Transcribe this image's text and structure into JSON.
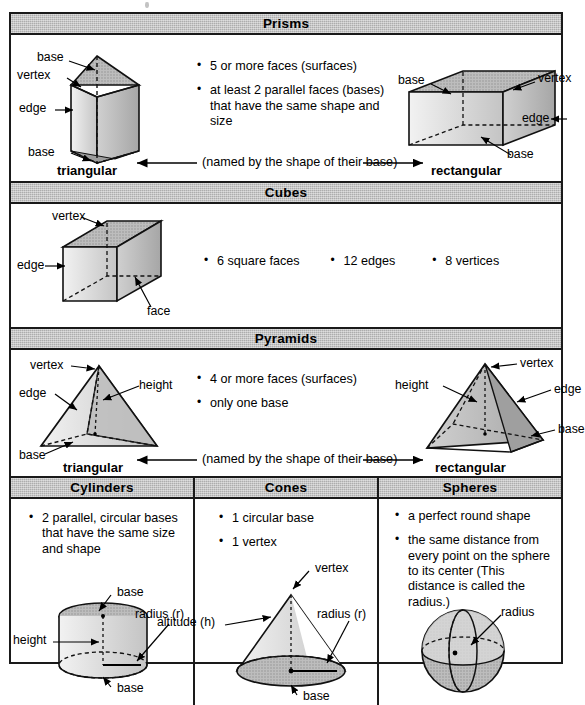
{
  "poster": {
    "title": "Solid Figures Reference Chart"
  },
  "sections": {
    "prisms": {
      "header": "Prisms",
      "bullets": [
        "5 or more faces (surfaces)",
        "at least 2 parallel faces (bases) that have the same shape and size"
      ],
      "named_by": "(named by the shape of their base)",
      "left_name": "triangular",
      "right_name": "rectangular",
      "left_labels": {
        "base_top": "base",
        "vertex": "vertex",
        "edge": "edge",
        "base_bottom": "base"
      },
      "right_labels": {
        "base_top": "base",
        "vertex": "vertex",
        "edge": "edge",
        "base_bottom": "base"
      }
    },
    "cubes": {
      "header": "Cubes",
      "bullets": [
        "6 square faces",
        "12 edges",
        "8 vertices"
      ],
      "labels": {
        "vertex": "vertex",
        "edge": "edge",
        "face": "face"
      }
    },
    "pyramids": {
      "header": "Pyramids",
      "bullets": [
        "4 or more faces (surfaces)",
        "only one base"
      ],
      "named_by": "(named by the shape of their base)",
      "left_name": "triangular",
      "right_name": "rectangular",
      "left_labels": {
        "vertex": "vertex",
        "height": "height",
        "edge": "edge",
        "base": "base"
      },
      "right_labels": {
        "vertex": "vertex",
        "height": "height",
        "edge": "edge",
        "base": "base"
      }
    },
    "cylinders": {
      "header": "Cylinders",
      "bullets": [
        "2 parallel, circular bases that have the same size and shape"
      ],
      "labels": {
        "base_top": "base",
        "radius": "radius (r)",
        "height": "height",
        "base_bottom": "base"
      }
    },
    "cones": {
      "header": "Cones",
      "bullets": [
        "1 circular base",
        "1 vertex"
      ],
      "labels": {
        "vertex": "vertex",
        "altitude": "altitude (h)",
        "radius": "radius (r)",
        "base": "base"
      }
    },
    "spheres": {
      "header": "Spheres",
      "bullets": [
        "a perfect round shape",
        "the same distance from every point on the sphere to its center (This distance is called the radius.)"
      ],
      "labels": {
        "radius": "radius"
      }
    }
  },
  "colors": {
    "band": "#adadad",
    "ink": "#1a1a1a",
    "fill_light": "#e8e8e8",
    "fill_mid": "#c9c9c9",
    "fill_dark": "#a8a8a8"
  }
}
